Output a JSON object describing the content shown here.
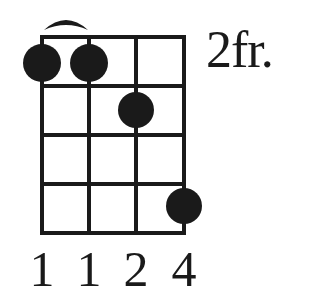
{
  "chord": {
    "fret_position_label": "2fr.",
    "strings": 4,
    "frets_shown": 4,
    "barre": {
      "from_string": 1,
      "to_string": 2,
      "fret": 1
    },
    "dots": [
      {
        "string": 1,
        "fret": 1
      },
      {
        "string": 2,
        "fret": 1
      },
      {
        "string": 3,
        "fret": 2
      },
      {
        "string": 4,
        "fret": 4
      }
    ],
    "fingering": [
      "1",
      "1",
      "2",
      "4"
    ],
    "colors": {
      "ink": "#1a1a1a",
      "background": "#ffffff"
    }
  }
}
